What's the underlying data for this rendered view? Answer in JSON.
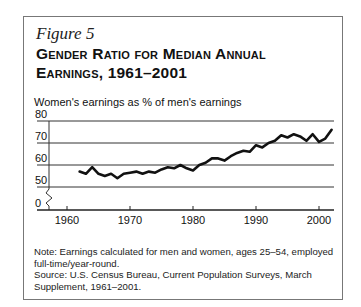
{
  "figure": {
    "label": "Figure 5",
    "title_line1": "Gender Ratio for Median Annual",
    "title_line2": "Earnings, 1961–2001",
    "ylabel": "Women's earnings as % of men's earnings",
    "note": "Note: Earnings calculated for men and women, ages 25–54, employed full-time/year-round.",
    "source": "Source: U.S. Census Bureau, Current Population Surveys, March Supplement, 1961–2001."
  },
  "colors": {
    "line": "#111111",
    "grid": "#333333",
    "frame": "#777777"
  },
  "chart_data": {
    "type": "line",
    "title": "Gender Ratio for Median Annual Earnings, 1961–2001",
    "xlabel": "",
    "ylabel": "Women's earnings as % of men's earnings",
    "x_ticks": [
      1960,
      1970,
      1980,
      1990,
      2000
    ],
    "y_ticks": [
      0,
      50,
      60,
      70,
      80
    ],
    "y_axis_break": "between 0 and 50",
    "ylim": [
      0,
      80
    ],
    "grid": "horizontal",
    "legend": "none",
    "x": [
      1962,
      1963,
      1964,
      1965,
      1966,
      1967,
      1968,
      1969,
      1970,
      1971,
      1972,
      1973,
      1974,
      1975,
      1976,
      1977,
      1978,
      1979,
      1980,
      1981,
      1982,
      1983,
      1984,
      1985,
      1986,
      1987,
      1988,
      1989,
      1990,
      1991,
      1992,
      1993,
      1994,
      1995,
      1996,
      1997,
      1998,
      1999,
      2000,
      2001,
      2002
    ],
    "series": [
      {
        "name": "Women's earnings as % of men's",
        "values": [
          57,
          56,
          59,
          56,
          55,
          56,
          54,
          56,
          56.5,
          57,
          56,
          57,
          56.5,
          58,
          59,
          58.5,
          60,
          58.5,
          57.5,
          60,
          61,
          63,
          63,
          62,
          64,
          65.5,
          66.5,
          66,
          69,
          68,
          70,
          71,
          73.5,
          72.5,
          74,
          73,
          71,
          74,
          70.5,
          72,
          76
        ]
      }
    ]
  }
}
